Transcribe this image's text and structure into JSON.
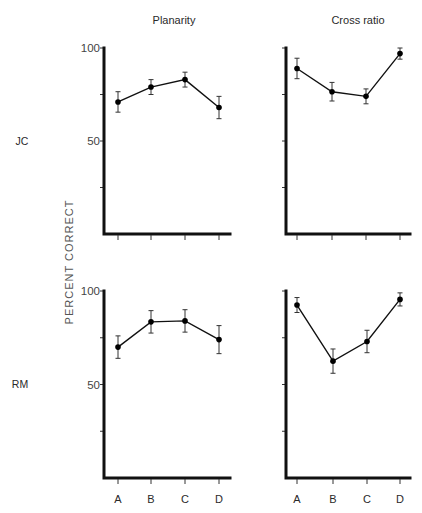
{
  "chart_data": [
    {
      "type": "line",
      "subject": "JC",
      "title": "Planarity",
      "xlabel": "",
      "ylabel": "PERCENT CORRECT",
      "categories": [
        "A",
        "B",
        "C",
        "D"
      ],
      "values": [
        71,
        79,
        83,
        68
      ],
      "errors": [
        5.5,
        4,
        4,
        6
      ],
      "ylim": [
        0,
        100
      ],
      "yticks": [
        25,
        50,
        75,
        100
      ],
      "ytick_labels": [
        "",
        "50",
        "",
        "100"
      ],
      "grid": false
    },
    {
      "type": "line",
      "subject": "JC",
      "title": "Cross ratio",
      "xlabel": "",
      "ylabel": "PERCENT CORRECT",
      "categories": [
        "A",
        "B",
        "C",
        "D"
      ],
      "values": [
        89,
        76.5,
        74,
        97
      ],
      "errors": [
        5.5,
        5,
        4,
        3
      ],
      "ylim": [
        0,
        100
      ],
      "yticks": [
        25,
        50,
        75,
        100
      ],
      "ytick_labels": [
        "",
        "",
        "",
        ""
      ],
      "grid": false
    },
    {
      "type": "line",
      "subject": "RM",
      "title": "Planarity",
      "xlabel": "",
      "ylabel": "PERCENT CORRECT",
      "categories": [
        "A",
        "B",
        "C",
        "D"
      ],
      "values": [
        70,
        83.5,
        84,
        74
      ],
      "errors": [
        6,
        6,
        6,
        7.5
      ],
      "ylim": [
        0,
        100
      ],
      "yticks": [
        25,
        50,
        75,
        100
      ],
      "ytick_labels": [
        "",
        "50",
        "",
        "100"
      ],
      "grid": false
    },
    {
      "type": "line",
      "subject": "RM",
      "title": "Cross ratio",
      "xlabel": "",
      "ylabel": "PERCENT CORRECT",
      "categories": [
        "A",
        "B",
        "C",
        "D"
      ],
      "values": [
        92.5,
        62.5,
        73,
        95.5
      ],
      "errors": [
        4,
        6.5,
        6,
        3.5
      ],
      "ylim": [
        0,
        100
      ],
      "yticks": [
        25,
        50,
        75,
        100
      ],
      "ytick_labels": [
        "",
        "",
        "",
        ""
      ],
      "grid": false
    }
  ],
  "figure": {
    "column_titles": [
      "Planarity",
      "Cross ratio"
    ],
    "row_labels": [
      "JC",
      "RM"
    ],
    "ylabel": "PERCENT CORRECT",
    "x_categories": [
      "A",
      "B",
      "C",
      "D"
    ],
    "colors": {
      "line": "#111111",
      "marker": "#000000",
      "axis": "#111111"
    }
  }
}
